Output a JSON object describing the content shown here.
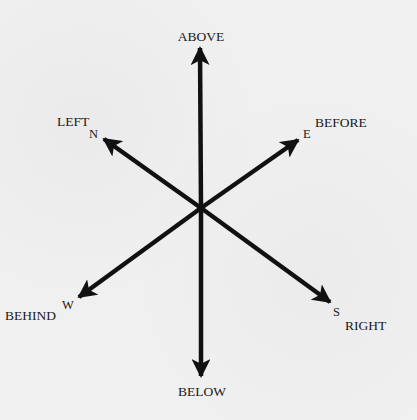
{
  "diagram": {
    "colors": {
      "background": "#f0f0f0",
      "ink": "#111111"
    },
    "axes": [
      {
        "id": "above",
        "label": "ABOVE",
        "letter": ""
      },
      {
        "id": "below",
        "label": "BELOW",
        "letter": ""
      },
      {
        "id": "left",
        "label": "LEFT",
        "letter": "N"
      },
      {
        "id": "before",
        "label": "BEFORE",
        "letter": "E"
      },
      {
        "id": "behind",
        "label": "BEHIND",
        "letter": "W"
      },
      {
        "id": "right",
        "label": "RIGHT",
        "letter": "S"
      }
    ]
  }
}
